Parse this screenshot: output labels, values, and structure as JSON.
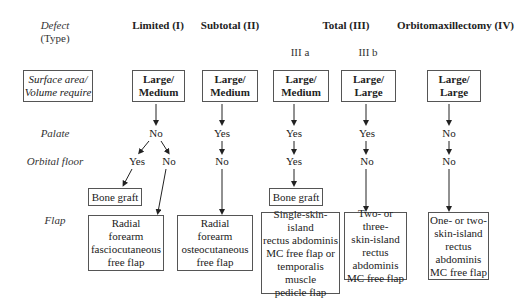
{
  "row_labels": {
    "defect": "Defect",
    "type": "(Type)",
    "surface": "Surface area/\nVolume require",
    "palate": "Palate",
    "orbital_floor": "Orbital floor",
    "flap": "Flap"
  },
  "columns": {
    "limited": {
      "header": "Limited (I)",
      "size": "Large/\nMedium",
      "palate": "No",
      "orbital_yes": "Yes",
      "orbital_no": "No",
      "bone_graft": "Bone graft",
      "flap": "Radial\nforearm\nfasciocutaneous\nfree flap"
    },
    "subtotal": {
      "header": "Subtotal (II)",
      "size": "Large/\nMedium",
      "palate": "Yes",
      "orbital": "No",
      "flap": "Radial\nforearm\nosteocutaneous\nfree flap"
    },
    "total": {
      "header": "Total (III)",
      "sub_a": "III a",
      "sub_b": "III b",
      "a_size": "Large/\nMedium",
      "a_palate": "Yes",
      "a_orbital": "Yes",
      "a_bone_graft": "Bone graft",
      "a_flap": "Single-skin-island\nrectus abdominis\nMC free flap or\ntemporalis\nmuscle\npedicle flap",
      "b_size": "Large/\nLarge",
      "b_palate": "Yes",
      "b_orbital": "No",
      "b_flap": "Two- or three-\nskin-island\nrectus\nabdominis\nMC free flap"
    },
    "orbito": {
      "header": "Orbitomaxillectomy (IV)",
      "size": "Large/\nLarge",
      "palate": "No",
      "orbital": "No",
      "flap": "One- or two-\nskin-island\nrectus\nabdominis\nMC free flap"
    }
  },
  "colors": {
    "line": "#222222",
    "box_border": "#555555",
    "background": "#ffffff"
  }
}
